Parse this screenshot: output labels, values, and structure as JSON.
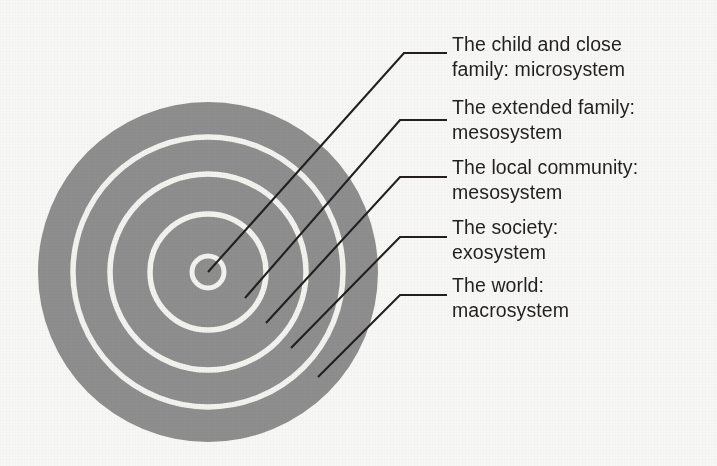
{
  "figure": {
    "background_color": "#f7f7f5",
    "circle_fill_color": "#8e8e8e",
    "ring_stroke_color": "#f2f2ef",
    "leader_line_color": "#231f20",
    "text_color": "#231f20"
  },
  "diagram": {
    "center_x": 208,
    "center_y": 272,
    "rings": [
      {
        "name": "microsystem-ring",
        "radius": 16
      },
      {
        "name": "mesosystem-inner-ring",
        "radius": 58
      },
      {
        "name": "mesosystem-outer-ring",
        "radius": 98
      },
      {
        "name": "exosystem-ring",
        "radius": 135
      },
      {
        "name": "macrosystem-outer-edge",
        "radius": 170
      }
    ]
  },
  "labels": [
    {
      "id": "microsystem",
      "line1": "The child and close",
      "line2": "family: microsystem",
      "text_x": 452,
      "text_y": 32,
      "leader": {
        "start_x": 208,
        "start_y": 272,
        "bend_x": 404,
        "bend_y": 53,
        "end_x": 447,
        "end_y": 53
      }
    },
    {
      "id": "mesosystem-extended-family",
      "line1": "The extended family:",
      "line2": "mesosystem",
      "text_x": 452,
      "text_y": 95,
      "leader": {
        "start_x": 245,
        "start_y": 298,
        "bend_x": 400,
        "bend_y": 120,
        "end_x": 447,
        "end_y": 120
      }
    },
    {
      "id": "mesosystem-local-community",
      "line1": "The local community:",
      "line2": "mesosystem",
      "text_x": 452,
      "text_y": 155,
      "leader": {
        "start_x": 266,
        "start_y": 323,
        "bend_x": 400,
        "bend_y": 177,
        "end_x": 447,
        "end_y": 177
      }
    },
    {
      "id": "exosystem",
      "line1": "The society:",
      "line2": "exosystem",
      "text_x": 452,
      "text_y": 215,
      "leader": {
        "start_x": 291,
        "start_y": 348,
        "bend_x": 400,
        "bend_y": 237,
        "end_x": 447,
        "end_y": 237
      }
    },
    {
      "id": "macrosystem",
      "line1": "The world:",
      "line2": "macrosystem",
      "text_x": 452,
      "text_y": 273,
      "leader": {
        "start_x": 318,
        "start_y": 377,
        "bend_x": 400,
        "bend_y": 295,
        "end_x": 447,
        "end_y": 295
      }
    }
  ]
}
